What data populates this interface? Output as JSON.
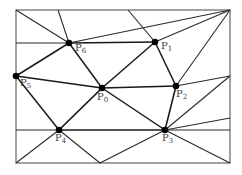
{
  "diagram": {
    "type": "triangulation",
    "frame": {
      "x1": 16,
      "y1": 10,
      "x2": 230,
      "y2": 163
    },
    "points": [
      {
        "id": "P0",
        "label": "P",
        "sub": "0",
        "x": 102,
        "y": 88,
        "lx": 97,
        "ly": 92
      },
      {
        "id": "P1",
        "label": "P",
        "sub": "1",
        "x": 155,
        "y": 42,
        "lx": 161,
        "ly": 41
      },
      {
        "id": "P2",
        "label": "P",
        "sub": "2",
        "x": 176,
        "y": 86,
        "lx": 176,
        "ly": 89
      },
      {
        "id": "P3",
        "label": "P",
        "sub": "3",
        "x": 165,
        "y": 130,
        "lx": 162,
        "ly": 133
      },
      {
        "id": "P4",
        "label": "P",
        "sub": "4",
        "x": 59,
        "y": 130,
        "lx": 55,
        "ly": 133
      },
      {
        "id": "P5",
        "label": "P",
        "sub": "5",
        "x": 16,
        "y": 76,
        "lx": 20,
        "ly": 78
      },
      {
        "id": "P6",
        "label": "P",
        "sub": "6",
        "x": 69,
        "y": 43,
        "lx": 75,
        "ly": 43
      }
    ],
    "edges": [
      [
        69,
        43,
        155,
        42,
        1
      ],
      [
        69,
        43,
        102,
        88,
        1
      ],
      [
        69,
        43,
        16,
        76,
        1
      ],
      [
        155,
        42,
        102,
        88,
        1
      ],
      [
        155,
        42,
        176,
        86,
        1
      ],
      [
        102,
        88,
        176,
        86,
        1
      ],
      [
        102,
        88,
        16,
        76,
        1
      ],
      [
        102,
        88,
        59,
        130,
        1
      ],
      [
        102,
        88,
        165,
        130,
        1
      ],
      [
        176,
        86,
        165,
        130,
        1
      ],
      [
        59,
        130,
        165,
        130,
        1
      ],
      [
        16,
        76,
        59,
        130,
        1
      ],
      [
        16,
        10,
        69,
        43,
        0
      ],
      [
        58,
        10,
        69,
        43,
        0
      ],
      [
        69,
        43,
        230,
        10,
        0
      ],
      [
        128,
        10,
        155,
        42,
        0
      ],
      [
        230,
        10,
        155,
        42,
        0
      ],
      [
        230,
        10,
        176,
        86,
        0
      ],
      [
        69,
        43,
        16,
        43,
        0
      ],
      [
        230,
        76,
        176,
        86,
        0
      ],
      [
        230,
        76,
        165,
        130,
        0
      ],
      [
        230,
        118,
        165,
        130,
        0
      ],
      [
        230,
        163,
        165,
        130,
        0
      ],
      [
        100,
        163,
        59,
        130,
        0
      ],
      [
        100,
        163,
        165,
        130,
        0
      ],
      [
        16,
        163,
        59,
        130,
        0
      ],
      [
        16,
        130,
        59,
        130,
        0
      ],
      [
        165,
        130,
        230,
        130,
        0
      ],
      [
        59,
        130,
        102,
        88,
        0
      ]
    ]
  }
}
